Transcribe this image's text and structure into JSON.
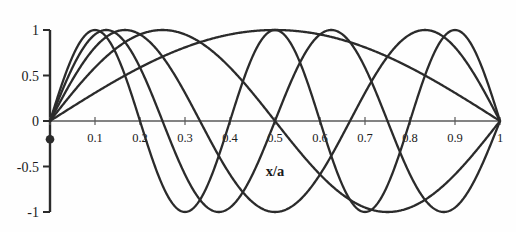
{
  "figure": {
    "name": "sine-eigenmodes-figure",
    "background_color": "#fefefe",
    "line_color": "#2b2b2b",
    "axis_color": "#555555",
    "text_color": "#1a1a1a"
  },
  "chart_data": {
    "type": "line",
    "title": "",
    "subtitle": "",
    "xlabel": "x/a",
    "ylabel": "",
    "xlim": [
      0,
      1
    ],
    "ylim": [
      -1,
      1
    ],
    "grid": false,
    "legend": null,
    "legend_position": "none",
    "x_ticks": [
      0,
      0.1,
      0.2,
      0.3,
      0.4,
      0.5,
      0.6,
      0.7,
      0.8,
      0.9,
      1
    ],
    "x_tick_labels": [
      "",
      "0.1",
      "0.2",
      "0.3",
      "0.4",
      "0.5",
      "0.6",
      "0.7",
      "0.8",
      "0.9",
      "1"
    ],
    "y_ticks": [
      -1,
      -0.5,
      0,
      0.5,
      1
    ],
    "y_tick_labels": [
      "-1",
      "-0.5",
      "0",
      "0.5",
      "1"
    ],
    "x": [
      0,
      0.02,
      0.04,
      0.06,
      0.08,
      0.1,
      0.12,
      0.14,
      0.16,
      0.18,
      0.2,
      0.22,
      0.24,
      0.26,
      0.28,
      0.3,
      0.32,
      0.34,
      0.36,
      0.38,
      0.4,
      0.42,
      0.44,
      0.46,
      0.48,
      0.5,
      0.52,
      0.54,
      0.56,
      0.58,
      0.6,
      0.62,
      0.64,
      0.66,
      0.68,
      0.7,
      0.72,
      0.74,
      0.76,
      0.78,
      0.8,
      0.82,
      0.84,
      0.86,
      0.88,
      0.9,
      0.92,
      0.94,
      0.96,
      0.98,
      1
    ],
    "series": [
      {
        "name": "n=1",
        "formula": "sin(1*pi*x/a)",
        "n": 1,
        "peaks": [
          {
            "x": 0.5,
            "y": 1
          }
        ],
        "zeros": [
          0,
          1
        ]
      },
      {
        "name": "n=2",
        "formula": "sin(2*pi*x/a)",
        "n": 2,
        "peaks": [
          {
            "x": 0.25,
            "y": 1
          },
          {
            "x": 0.75,
            "y": -1
          }
        ],
        "zeros": [
          0,
          0.5,
          1
        ]
      },
      {
        "name": "n=3",
        "formula": "sin(3*pi*x/a)",
        "n": 3,
        "peaks": [
          {
            "x": 0.1667,
            "y": 1
          },
          {
            "x": 0.5,
            "y": -1
          },
          {
            "x": 0.8333,
            "y": 1
          }
        ],
        "zeros": [
          0,
          0.3333,
          0.6667,
          1
        ]
      },
      {
        "name": "n=4",
        "formula": "sin(4*pi*x/a)",
        "n": 4,
        "peaks": [
          {
            "x": 0.125,
            "y": 1
          },
          {
            "x": 0.375,
            "y": -1
          },
          {
            "x": 0.625,
            "y": 1
          },
          {
            "x": 0.875,
            "y": -1
          }
        ],
        "zeros": [
          0,
          0.25,
          0.5,
          0.75,
          1
        ]
      },
      {
        "name": "n=5",
        "formula": "sin(5*pi*x/a)",
        "n": 5,
        "peaks": [
          {
            "x": 0.1,
            "y": 1
          },
          {
            "x": 0.3,
            "y": -1
          },
          {
            "x": 0.5,
            "y": 1
          },
          {
            "x": 0.7,
            "y": -1
          },
          {
            "x": 0.9,
            "y": 1
          }
        ],
        "zeros": [
          0,
          0.2,
          0.4,
          0.6,
          0.8,
          1
        ]
      }
    ],
    "annotations": [
      {
        "name": "origin-marker-dot",
        "type": "point",
        "x": 0,
        "y": -0.2,
        "label": ""
      }
    ]
  }
}
